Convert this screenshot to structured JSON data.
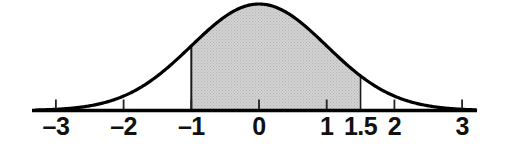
{
  "chart_data": {
    "type": "area",
    "title": "",
    "subtitle": "",
    "xlabel": "",
    "ylabel": "",
    "curve": "standard normal density",
    "mean": 0,
    "sd": 1,
    "xlim": [
      -3.3,
      3.2
    ],
    "ylim": [
      0,
      0.42
    ],
    "grid": false,
    "legend": false,
    "tick_labels": [
      "–3",
      "–2",
      "–1",
      "0",
      "1",
      "1.5",
      "2",
      "3"
    ],
    "tick_values": [
      -3,
      -2,
      -1,
      0,
      1,
      1.5,
      2,
      3
    ],
    "shaded_region": {
      "from": -1,
      "to": 1.5,
      "from_label": "–1",
      "to_label": "1.5",
      "fill": "#c9c9c9"
    },
    "x": [
      -3.3,
      -3,
      -2.5,
      -2,
      -1.5,
      -1,
      -0.5,
      0,
      0.5,
      1,
      1.5,
      2,
      2.5,
      3,
      3.2
    ],
    "y": [
      0.0017,
      0.0044,
      0.0175,
      0.054,
      0.1295,
      0.242,
      0.3521,
      0.3989,
      0.3521,
      0.242,
      0.1295,
      0.054,
      0.0175,
      0.0044,
      0.0024
    ]
  },
  "axis": {
    "line_color": "#000000",
    "curve_color": "#000000",
    "boundary_color": "#000000"
  },
  "ticks": [
    {
      "label": "–3",
      "value": -3
    },
    {
      "label": "–2",
      "value": -2
    },
    {
      "label": "–1",
      "value": -1
    },
    {
      "label": "0",
      "value": 0
    },
    {
      "label": "1",
      "value": 1
    },
    {
      "label": "1.5",
      "value": 1.5
    },
    {
      "label": "2",
      "value": 2
    },
    {
      "label": "3",
      "value": 3
    }
  ]
}
